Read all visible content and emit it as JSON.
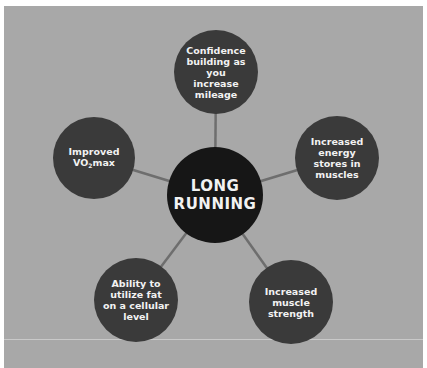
{
  "diagram": {
    "center": {
      "label_line1": "LONG",
      "label_line2": "RUNNING"
    },
    "nodes": [
      {
        "id": "top",
        "label": "Confidence building as you increase mileage"
      },
      {
        "id": "right",
        "label": "Increased energy stores in muscles"
      },
      {
        "id": "bottom-right",
        "label": "Increased muscle strength"
      },
      {
        "id": "bottom-left",
        "label": "Ability to utilize fat on a cellular level"
      },
      {
        "id": "left",
        "label_prefix": "Improved VO",
        "label_sub": "2",
        "label_suffix": "max"
      }
    ],
    "colors": {
      "background": "#a8a8a8",
      "center_fill": "#161616",
      "node_fill": "#3a3a3a",
      "link": "#6e6e6e",
      "text": "#f2f2f2"
    }
  }
}
